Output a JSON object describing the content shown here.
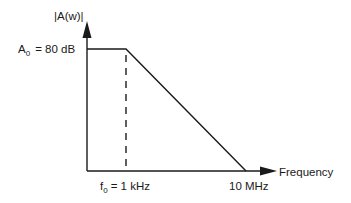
{
  "diagram": {
    "type": "bode-magnitude-plot",
    "y_axis": {
      "label": "|A(w)|"
    },
    "x_axis": {
      "label": "Frequency"
    },
    "gain_label": {
      "symbol": "A",
      "subscript": "0",
      "value": "= 80 dB"
    },
    "corner_frequency_label": {
      "symbol": "f",
      "subscript": "0",
      "value": "= 1 kHz"
    },
    "unity_gain_label": "10 MHz",
    "colors": {
      "line": "#1a1a1a",
      "background": "#ffffff"
    }
  }
}
